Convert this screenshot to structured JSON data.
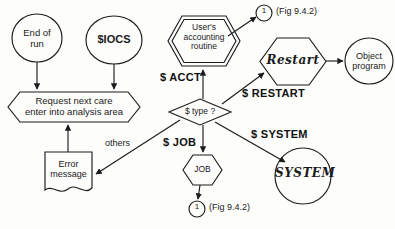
{
  "diagram": {
    "title_caption": "",
    "background_color": "#fdfdfc",
    "line_color": "#1c1c1c",
    "nodes": {
      "end_of_run": {
        "line1": "End of",
        "line2": "run",
        "shape": "circle"
      },
      "iocs": {
        "label": "$IOCS",
        "shape": "circle"
      },
      "request_next": {
        "line1": "Request next care",
        "line2": "enter into analysis area",
        "shape": "hexagon-flat"
      },
      "error_message": {
        "line1": "Error",
        "line2": "message",
        "shape": "document"
      },
      "users_routine": {
        "line1": "User's",
        "line2": "accounting",
        "line3": "routine",
        "shape": "double-hexagon"
      },
      "decision": {
        "label": "$ type ?",
        "shape": "diamond"
      },
      "restart": {
        "label": "Restart",
        "shape": "hexagon"
      },
      "object_program": {
        "line1": "Object",
        "line2": "program",
        "shape": "circle"
      },
      "system": {
        "label": "SYSTEM",
        "shape": "circle"
      },
      "job": {
        "label": "JOB",
        "shape": "hexagon"
      },
      "connector_top": {
        "label": "1",
        "caption": "(Fig 9.4.2)",
        "shape": "connector-circle"
      },
      "connector_bottom": {
        "label": "1",
        "caption": "(Fig 9.4.2)",
        "shape": "connector-circle"
      }
    },
    "edge_labels": {
      "acct": "$ ACCT",
      "restart": "$ RESTART",
      "system": "$ SYSTEM",
      "job": "$ JOB",
      "others": "others"
    }
  }
}
